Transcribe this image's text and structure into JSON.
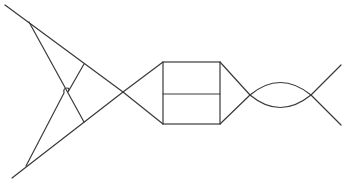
{
  "diagram": {
    "stroke_color": "#3a3a3a",
    "background": "#ffffff",
    "left_triangle": {
      "upper_line": [
        [
          5,
          5
        ],
        [
          29,
          22
        ],
        [
          123,
          92
        ]
      ],
      "lower_line": [
        [
          12,
          178
        ],
        [
          26,
          166
        ],
        [
          123,
          92
        ]
      ],
      "inner_upper": [
        [
          29,
          22
        ],
        [
          66,
          90
        ],
        [
          84,
          122
        ]
      ],
      "inner_lower": [
        [
          26,
          166
        ],
        [
          66,
          90
        ],
        [
          84,
          64
        ]
      ]
    },
    "crossing_point": [
      123,
      92
    ],
    "rectangle": {
      "left": 163,
      "right": 220,
      "top": 62,
      "mid": 94,
      "bottom": 124
    },
    "right_cone": {
      "apex": [
        250,
        95
      ]
    },
    "lens": {
      "left": [
        250,
        95
      ],
      "right": [
        311,
        95
      ],
      "upper_peak_y": 83,
      "lower_trough_y": 107
    },
    "tail": {
      "upper_end": [
        341,
        65
      ],
      "lower_end": [
        341,
        125
      ]
    }
  }
}
